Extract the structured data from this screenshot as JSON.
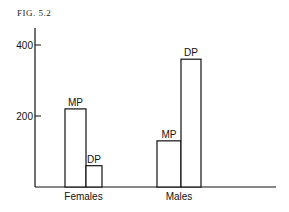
{
  "figure_label": "FIG. 5.2",
  "chart_data": {
    "type": "bar",
    "title": "",
    "xlabel": "",
    "ylabel": "",
    "categories": [
      "Females",
      "Males"
    ],
    "series": [
      {
        "name": "MP",
        "values": [
          220,
          130
        ]
      },
      {
        "name": "DP",
        "values": [
          60,
          360
        ]
      }
    ],
    "yticks": [
      200,
      400
    ],
    "ytick_labels": [
      "200",
      "400"
    ],
    "ylim": [
      0,
      450
    ],
    "grid": false,
    "legend": "bar labels above each bar"
  }
}
